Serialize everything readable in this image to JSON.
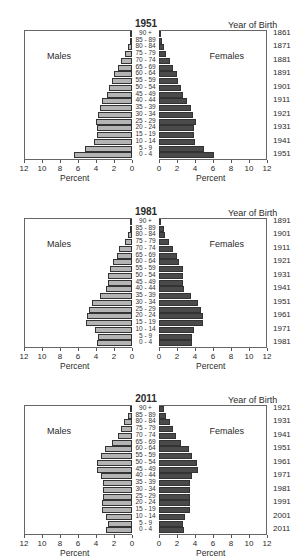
{
  "chart_data": [
    {
      "type": "bar",
      "subtype": "population-pyramid",
      "title": "1951",
      "age_groups": [
        "0 - 4",
        "5 - 9",
        "10 - 14",
        "15 - 19",
        "20 - 24",
        "25 - 29",
        "30 - 34",
        "35 - 39",
        "40 - 44",
        "45 - 49",
        "50 - 54",
        "55 - 59",
        "60 - 64",
        "65 - 69",
        "70 - 74",
        "75 - 79",
        "80 - 84",
        "85 - 89",
        "90 +"
      ],
      "series": [
        {
          "name": "Males",
          "color": "#b4b4b4",
          "values": [
            6.5,
            5.2,
            4.2,
            3.9,
            3.9,
            4.0,
            3.8,
            3.6,
            3.3,
            2.8,
            2.6,
            2.2,
            2.0,
            1.6,
            1.2,
            0.8,
            0.4,
            0.2,
            0.05
          ]
        },
        {
          "name": "Females",
          "color": "#4a4a4a",
          "values": [
            6.1,
            5.0,
            4.0,
            3.9,
            3.9,
            4.1,
            3.8,
            3.6,
            3.1,
            2.7,
            2.4,
            2.1,
            2.0,
            1.6,
            1.2,
            0.8,
            0.5,
            0.3,
            0.1
          ]
        }
      ],
      "xlabel": "Percent",
      "xlim": [
        0,
        12
      ],
      "xticks": [
        "12",
        "10",
        "8",
        "6",
        "4",
        "2",
        "0"
      ],
      "xticks_right": [
        "0",
        "2",
        "4",
        "6",
        "8",
        "10",
        "12"
      ],
      "secondary_axis_title": "Year of Birth",
      "year_of_birth_labels": [
        "1861",
        "1871",
        "1881",
        "1891",
        "1901",
        "1911",
        "1921",
        "1931",
        "1941",
        "1951"
      ],
      "legend": [
        "Males",
        "Females"
      ]
    },
    {
      "type": "bar",
      "subtype": "population-pyramid",
      "title": "1981",
      "age_groups": [
        "0 - 4",
        "5 - 9",
        "10 - 14",
        "15 - 19",
        "20 - 24",
        "25 - 29",
        "30 - 34",
        "35 - 39",
        "40 - 44",
        "45 - 49",
        "50 - 54",
        "55 - 59",
        "60 - 64",
        "65 - 69",
        "70 - 74",
        "75 - 79",
        "80 - 84",
        "85 - 89",
        "90 +"
      ],
      "series": [
        {
          "name": "Males",
          "color": "#b4b4b4",
          "values": [
            3.9,
            3.8,
            4.1,
            5.1,
            5.0,
            4.8,
            4.4,
            3.6,
            2.9,
            2.7,
            2.7,
            2.5,
            2.1,
            1.7,
            1.4,
            0.8,
            0.4,
            0.2,
            0.1
          ]
        },
        {
          "name": "Females",
          "color": "#4a4a4a",
          "values": [
            3.7,
            3.7,
            3.9,
            4.9,
            4.9,
            4.7,
            4.3,
            3.5,
            2.8,
            2.7,
            2.7,
            2.7,
            2.2,
            2.0,
            1.5,
            1.1,
            0.7,
            0.5,
            0.2
          ]
        }
      ],
      "xlabel": "Percent",
      "xlim": [
        0,
        12
      ],
      "xticks": [
        "12",
        "10",
        "8",
        "6",
        "4",
        "2",
        "0"
      ],
      "xticks_right": [
        "0",
        "2",
        "4",
        "6",
        "8",
        "10",
        "12"
      ],
      "secondary_axis_title": "Year of Birth",
      "year_of_birth_labels": [
        "1891",
        "1901",
        "1911",
        "1921",
        "1931",
        "1941",
        "1951",
        "1961",
        "1971",
        "1981"
      ],
      "legend": [
        "Males",
        "Females"
      ]
    },
    {
      "type": "bar",
      "subtype": "population-pyramid",
      "title": "2011",
      "age_groups": [
        "0 - 4",
        "5 - 9",
        "10 - 14",
        "15 - 19",
        "20 - 24",
        "25 - 29",
        "30 - 34",
        "35 - 39",
        "40 - 44",
        "45 - 49",
        "50 - 54",
        "55 - 59",
        "60 - 64",
        "65 - 69",
        "70 - 74",
        "75 - 79",
        "80 - 84",
        "85 - 89",
        "90 +"
      ],
      "series": [
        {
          "name": "Males",
          "color": "#b4b4b4",
          "values": [
            2.9,
            2.7,
            2.9,
            3.3,
            3.3,
            3.2,
            3.2,
            3.2,
            3.4,
            3.9,
            3.9,
            3.4,
            3.0,
            2.2,
            1.6,
            1.2,
            0.9,
            0.4,
            0.1
          ]
        },
        {
          "name": "Females",
          "color": "#4a4a4a",
          "values": [
            2.8,
            2.7,
            2.9,
            3.4,
            3.4,
            3.4,
            3.4,
            3.4,
            3.7,
            4.3,
            4.2,
            3.7,
            3.3,
            2.4,
            1.9,
            1.6,
            1.2,
            0.8,
            0.5
          ]
        }
      ],
      "xlabel": "Percent",
      "xlim": [
        0,
        12
      ],
      "xticks": [
        "12",
        "10",
        "8",
        "6",
        "4",
        "2",
        "0"
      ],
      "xticks_right": [
        "0",
        "2",
        "4",
        "6",
        "8",
        "10",
        "12"
      ],
      "secondary_axis_title": "Year of Birth",
      "year_of_birth_labels": [
        "1921",
        "1931",
        "1941",
        "1951",
        "1961",
        "1971",
        "1981",
        "1991",
        "2001",
        "2011"
      ],
      "legend": [
        "Males",
        "Females"
      ]
    }
  ],
  "labels": {
    "males": "Males",
    "females": "Females",
    "percent": "Percent",
    "year_of_birth": "Year of Birth"
  }
}
